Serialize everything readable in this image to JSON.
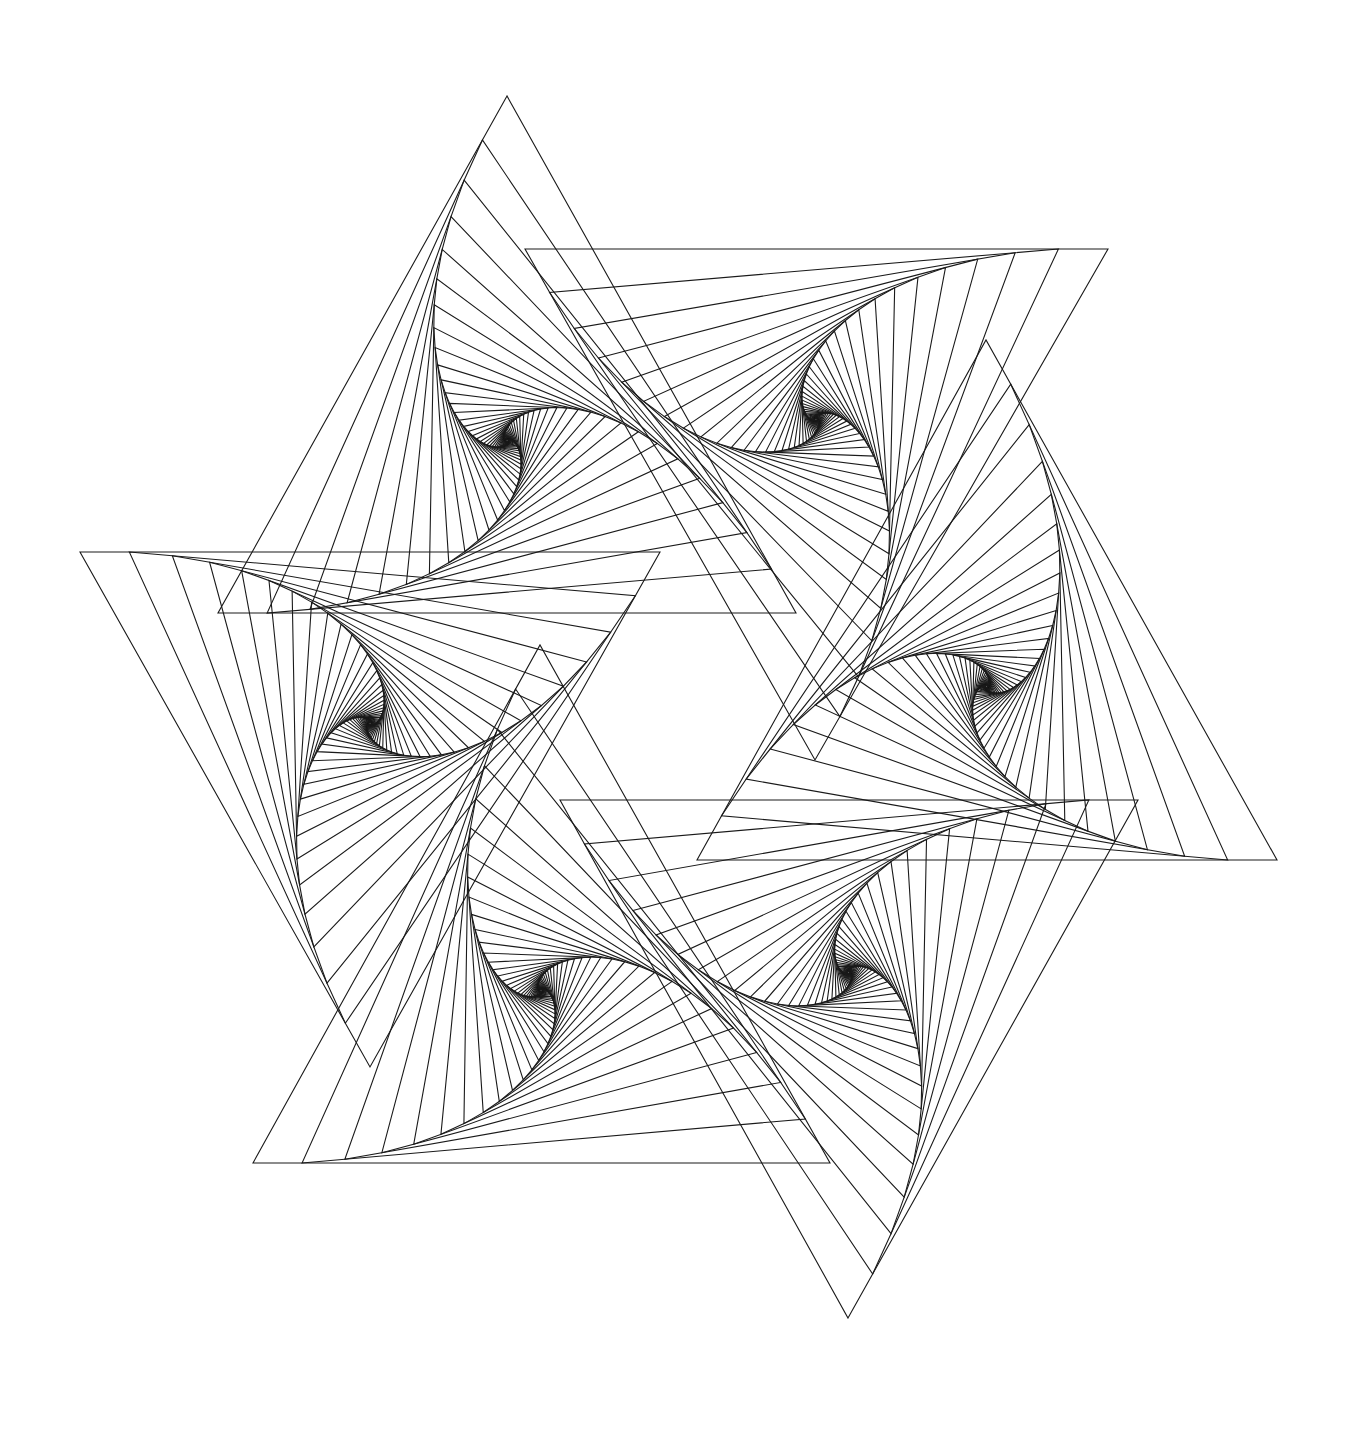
{
  "artwork": {
    "title": "Hexagram of six whirling triangles",
    "background": "#ffffff",
    "stroke_color": "#1a1a1a",
    "stroke_width": 1.1,
    "iterations": 46,
    "step_fraction": 0.085,
    "core_marker_color": "#ffffff",
    "vortices": [
      {
        "id": "top-left",
        "vertices": [
          [
            507,
            96
          ],
          [
            218,
            613
          ],
          [
            796,
            613
          ]
        ],
        "direction": 1
      },
      {
        "id": "top-right",
        "vertices": [
          [
            1108,
            249
          ],
          [
            525,
            249
          ],
          [
            815,
            760
          ]
        ],
        "direction": 1
      },
      {
        "id": "right",
        "vertices": [
          [
            1277,
            860
          ],
          [
            697,
            860
          ],
          [
            986,
            340
          ]
        ],
        "direction": 1
      },
      {
        "id": "bottom-right",
        "vertices": [
          [
            848,
            1318
          ],
          [
            1138,
            800
          ],
          [
            560,
            800
          ]
        ],
        "direction": 1
      },
      {
        "id": "bottom-left",
        "vertices": [
          [
            253,
            1163
          ],
          [
            830,
            1163
          ],
          [
            540,
            645
          ]
        ],
        "direction": 1
      },
      {
        "id": "left",
        "vertices": [
          [
            80,
            552
          ],
          [
            660,
            552
          ],
          [
            370,
            1067
          ]
        ],
        "direction": 1
      }
    ]
  }
}
